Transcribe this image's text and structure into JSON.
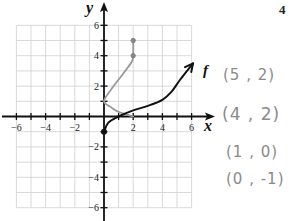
{
  "problem_number": "4",
  "graph": {
    "axis_labels": {
      "x": "x",
      "y": "y"
    },
    "x_ticks": [
      {
        "value": -6,
        "label": "−6"
      },
      {
        "value": -4,
        "label": "−4"
      },
      {
        "value": -2,
        "label": "−2"
      },
      {
        "value": 2,
        "label": "2"
      },
      {
        "value": 4,
        "label": "4"
      },
      {
        "value": 6,
        "label": "6"
      }
    ],
    "y_ticks": [
      {
        "value": 6,
        "label": "6"
      },
      {
        "value": 4,
        "label": "4"
      },
      {
        "value": 2,
        "label": "2"
      },
      {
        "value": -2,
        "label": "−2"
      },
      {
        "value": -4,
        "label": "−4"
      },
      {
        "value": -6,
        "label": "−6"
      }
    ],
    "range": {
      "x": [
        -6,
        6
      ],
      "y": [
        -6,
        6
      ]
    },
    "function_label": "f",
    "function_curve": {
      "color": "#111111",
      "points": [
        [
          0,
          -1
        ],
        [
          0.3,
          -0.4
        ],
        [
          1,
          0
        ],
        [
          2,
          0.4
        ],
        [
          3,
          0.7
        ],
        [
          4,
          1.1
        ],
        [
          4.6,
          1.6
        ],
        [
          5.2,
          2.4
        ],
        [
          6.1,
          3.5
        ]
      ],
      "start_point": [
        0,
        -1
      ]
    },
    "inverse_sketch": {
      "color": "#999999",
      "points": [
        [
          2,
          0
        ],
        [
          1,
          0.3
        ],
        [
          0.5,
          0.6
        ],
        [
          0,
          1
        ],
        [
          0.5,
          1.8
        ],
        [
          1.3,
          2.8
        ],
        [
          1.9,
          3.6
        ],
        [
          2,
          4
        ],
        [
          2,
          5
        ]
      ],
      "marked_points": [
        [
          2,
          4
        ],
        [
          2,
          5
        ]
      ]
    }
  },
  "handwritten_notes": [
    "(5 , 2)",
    "(4 , 2)",
    "(1 , 0)",
    "(0 , -1)"
  ]
}
